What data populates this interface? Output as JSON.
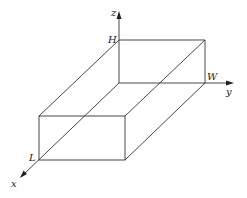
{
  "diagram": {
    "type": "3d-box-coordinate-sketch",
    "axes": {
      "x": {
        "label": "x"
      },
      "y": {
        "label": "y"
      },
      "z": {
        "label": "z"
      }
    },
    "dimension_labels": {
      "length": "L",
      "width": "W",
      "height": "H"
    },
    "colors": {
      "line": "#333333",
      "background": "#ffffff"
    }
  }
}
